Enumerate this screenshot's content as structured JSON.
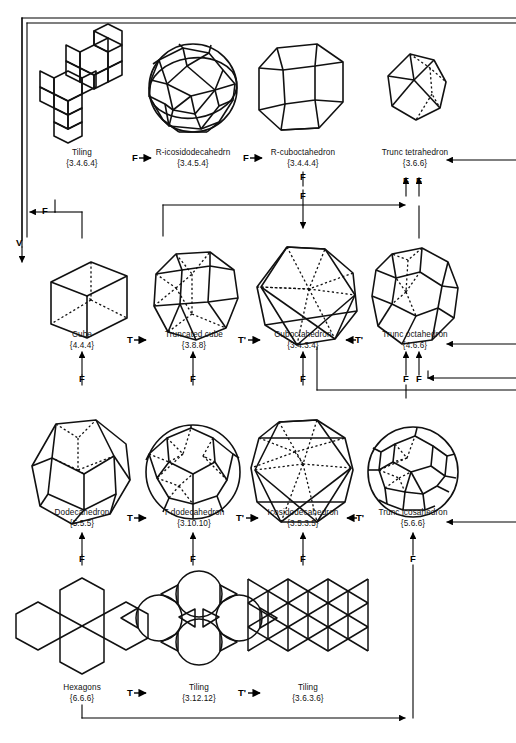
{
  "figure": {
    "title_visible": false,
    "line_color": "#000000",
    "background": "#ffffff"
  },
  "operations": {
    "F": "F",
    "T": "T",
    "T_prime": "T'",
    "V": "V"
  },
  "rows": [
    {
      "id": "row-1",
      "cells": [
        {
          "id": "tiling-3464",
          "name": "Tiling",
          "code": "{3.4.6.4}"
        },
        {
          "id": "r-icosidodecahedron",
          "name": "R-icosidodecahedrn",
          "code": "{3.4.5.4}"
        },
        {
          "id": "r-cuboctahedron",
          "name": "R-cuboctahedron",
          "code": "{3.4.4.4}"
        },
        {
          "id": "trunc-tetrahedron",
          "name": "Trunc tetrahedron",
          "code": "{3.6.6}"
        }
      ],
      "between_labels": [
        "F",
        "F",
        ""
      ]
    },
    {
      "id": "row-2",
      "cells": [
        {
          "id": "cube",
          "name": "Cube",
          "code": "{4.4.4}"
        },
        {
          "id": "truncated-cube",
          "name": "Truncated cube",
          "code": "{3.8.8}"
        },
        {
          "id": "cuboctahedron",
          "name": "Cuboctahedron",
          "code": "{3.4.3.4}"
        },
        {
          "id": "trunc-octahedron",
          "name": "Trunc octahedron",
          "code": "{4.6.6}"
        }
      ],
      "between_labels": [
        "T",
        "T'",
        "T'"
      ]
    },
    {
      "id": "row-3",
      "cells": [
        {
          "id": "dodecahedron",
          "name": "Dodecahedron",
          "code": "{5.5.5}"
        },
        {
          "id": "t-dodecahedron",
          "name": "T dodecahedron",
          "code": "{3.10.10}"
        },
        {
          "id": "icosidodecahedron",
          "name": "Icosidodecahedron",
          "code": "{3.5.3.5}"
        },
        {
          "id": "trunc-icosahedron",
          "name": "Trunc icosahedron",
          "code": "{5.6.6}"
        }
      ],
      "between_labels": [
        "T",
        "T'",
        "T'"
      ]
    },
    {
      "id": "row-4",
      "cells": [
        {
          "id": "hexagons",
          "name": "Hexagons",
          "code": "{6.6.6}"
        },
        {
          "id": "tiling-31212",
          "name": "Tiling",
          "code": "{3.12.12}"
        },
        {
          "id": "tiling-3636",
          "name": "Tiling",
          "code": "{3.6.3.6}"
        }
      ],
      "between_labels": [
        "T",
        "T'"
      ]
    }
  ],
  "column_arrow_labels": {
    "row1_to_row2_cuboctahedron": "F",
    "row1_trunc_tetra_left": "F",
    "row1_trunc_tetra_right": "F",
    "row2_cube": "F",
    "row2_truncated_cube": "F",
    "row2_cuboctahedron": "F",
    "row2_trunc_octahedron_left": "F",
    "row2_trunc_octahedron_right": "F",
    "row3_dodecahedron": "F",
    "row3_t_dodecahedron": "F",
    "row3_icosidodecahedron": "F",
    "row3_trunc_icosahedron_left": "F",
    "row3_trunc_icosahedron_right": "F",
    "row4_hexagons": "F",
    "row4_tiling_31212": "F",
    "row4_tiling_3636": "F",
    "left_loop": "F",
    "vertex_loop": "V"
  }
}
